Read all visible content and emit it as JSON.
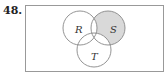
{
  "problem_number": "48.",
  "diagram": {
    "type": "venn",
    "sets": [
      {
        "label": "R",
        "cx": 80,
        "cy": 28,
        "r": 17
      },
      {
        "label": "S",
        "cx": 108,
        "cy": 28,
        "r": 17
      },
      {
        "label": "T",
        "cx": 94,
        "cy": 50,
        "r": 17
      }
    ],
    "shaded_region": "S only (S minus R and T)",
    "shade_color": "#d9d9d9",
    "stroke_color": "#888888"
  }
}
